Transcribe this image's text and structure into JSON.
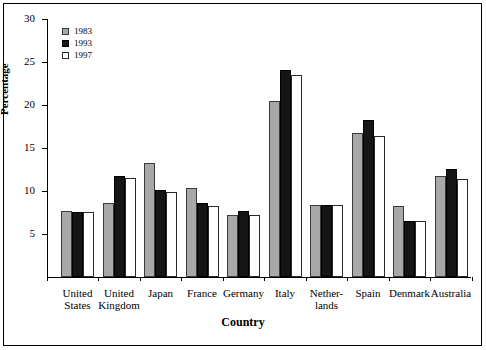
{
  "chart_data": {
    "type": "bar",
    "title": "",
    "xlabel": "Country",
    "ylabel": "Percentage",
    "ylim": [
      0,
      30
    ],
    "yticks": [
      0,
      5,
      10,
      15,
      20,
      25,
      30
    ],
    "ytick_labels": [
      "",
      "5",
      "10",
      "15",
      "20",
      "25",
      "30"
    ],
    "grid": false,
    "legend_position": "top-left",
    "categories": [
      "United\nStates",
      "United\nKingdom",
      "Japan",
      "France",
      "Germany",
      "Italy",
      "Nether-\nlands",
      "Spain",
      "Denmark",
      "Australia"
    ],
    "series": [
      {
        "name": "1983",
        "color": "#a8a8a8",
        "values": [
          7.7,
          8.6,
          13.3,
          10.4,
          7.2,
          20.5,
          8.4,
          16.7,
          8.2,
          11.8
        ]
      },
      {
        "name": "1993",
        "color": "#151515",
        "values": [
          7.6,
          11.8,
          10.1,
          8.6,
          7.7,
          24.1,
          8.4,
          18.2,
          6.5,
          12.6
        ]
      },
      {
        "name": "1997",
        "color": "#ffffff",
        "values": [
          7.6,
          11.5,
          9.9,
          8.2,
          7.2,
          23.5,
          8.4,
          16.4,
          6.5,
          11.4
        ]
      }
    ]
  },
  "legend": {
    "items": [
      {
        "label": "1983",
        "swatch": "gray-filled-square-icon"
      },
      {
        "label": "1993",
        "swatch": "black-filled-square-icon"
      },
      {
        "label": "1997",
        "swatch": "white-open-square-icon"
      }
    ]
  }
}
